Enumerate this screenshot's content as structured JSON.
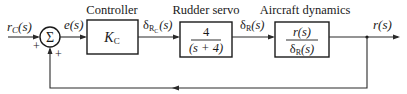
{
  "diagram": {
    "type": "feedback-control-block-diagram",
    "input": {
      "signal": "r",
      "subscript": "C",
      "arg": "(s)"
    },
    "summing_junction": {
      "symbol": "Σ",
      "input_sign": "+",
      "feedback_sign": "+"
    },
    "error": {
      "signal": "e",
      "arg": "(s)"
    },
    "blocks": [
      {
        "title": "Controller",
        "content": "K",
        "content_sub": "C"
      },
      {
        "title": "Rudder servo",
        "numerator": "4",
        "denominator": "(s + 4)"
      },
      {
        "title": "Aircraft dynamics",
        "numerator": "r(s)",
        "denominator_main": "δ",
        "denominator_sub": "R",
        "denominator_arg": "(s)"
      }
    ],
    "signals": {
      "controller_out": {
        "main": "δ",
        "sub": "R",
        "subsub": "C",
        "arg": "(s)"
      },
      "servo_out": {
        "main": "δ",
        "sub": "R",
        "arg": "(s)"
      },
      "output": {
        "signal": "r",
        "arg": "(s)"
      }
    },
    "colors": {
      "line": "#2a2a2a",
      "text": "#1a1a1a",
      "background": "#ffffff"
    }
  }
}
